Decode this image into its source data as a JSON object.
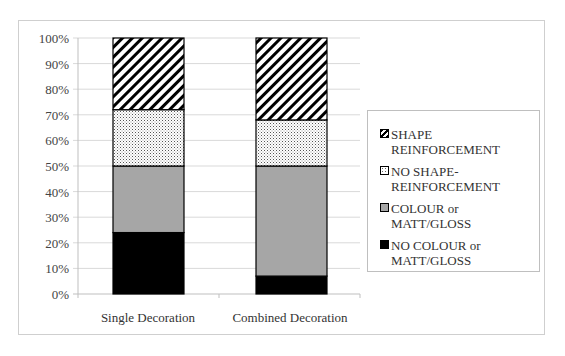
{
  "chart_data": {
    "type": "bar",
    "stacked": true,
    "percent": true,
    "title": "",
    "xlabel": "",
    "ylabel": "",
    "categories": [
      "Single Decoration",
      "Combined Decoration"
    ],
    "series": [
      {
        "name": "NO COLOUR or MATT/GLOSS",
        "pattern": "solid-black",
        "color": "#000000",
        "values": [
          24,
          7
        ]
      },
      {
        "name": "COLOUR or MATT/GLOSS",
        "pattern": "solid-grey",
        "color": "#a6a6a6",
        "values": [
          26,
          43
        ]
      },
      {
        "name": "NO SHAPE-REINFORCEMENT",
        "pattern": "dots",
        "color": "#ffffff",
        "values": [
          22,
          18
        ]
      },
      {
        "name": "SHAPE REINFORCEMENT",
        "pattern": "diagonal-hatch",
        "color": "#ffffff",
        "values": [
          28,
          32
        ]
      }
    ],
    "ylim": [
      0,
      100
    ],
    "yticks": [
      "0%",
      "10%",
      "20%",
      "30%",
      "40%",
      "50%",
      "60%",
      "70%",
      "80%",
      "90%",
      "100%"
    ],
    "grid": true,
    "legend_position": "right"
  },
  "legend": {
    "items": [
      {
        "line1": "SHAPE",
        "line2": "REINFORCEMENT",
        "pattern": "diagonal-hatch"
      },
      {
        "line1": "NO SHAPE-",
        "line2": "REINFORCEMENT",
        "pattern": "dots"
      },
      {
        "line1": "COLOUR or",
        "line2": "MATT/GLOSS",
        "pattern": "solid-grey"
      },
      {
        "line1": "NO COLOUR or",
        "line2": "MATT/GLOSS",
        "pattern": "solid-black"
      }
    ]
  },
  "colors": {
    "grid": "#d9d9d9",
    "axis": "#bfbfbf",
    "grey_fill": "#a6a6a6",
    "black_fill": "#000000"
  }
}
